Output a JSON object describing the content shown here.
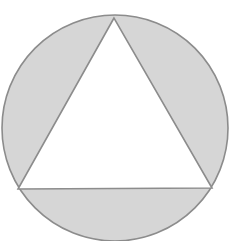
{
  "diagram": {
    "colors": {
      "background": "#ffffff",
      "segment_fill": "#d6d6d6",
      "stroke": "#8c8c8c",
      "triangle_fill": "#ffffff"
    },
    "circle": {
      "cx": 115,
      "cy": 128,
      "r": 113
    },
    "triangle": {
      "vertices": [
        {
          "name": "top",
          "x": 114,
          "y": 18
        },
        {
          "name": "bottom-left",
          "x": 18,
          "y": 189
        },
        {
          "name": "bottom-right",
          "x": 212,
          "y": 188
        }
      ]
    },
    "shaded_regions": [
      "left-segment",
      "right-segment",
      "bottom-segment"
    ]
  }
}
